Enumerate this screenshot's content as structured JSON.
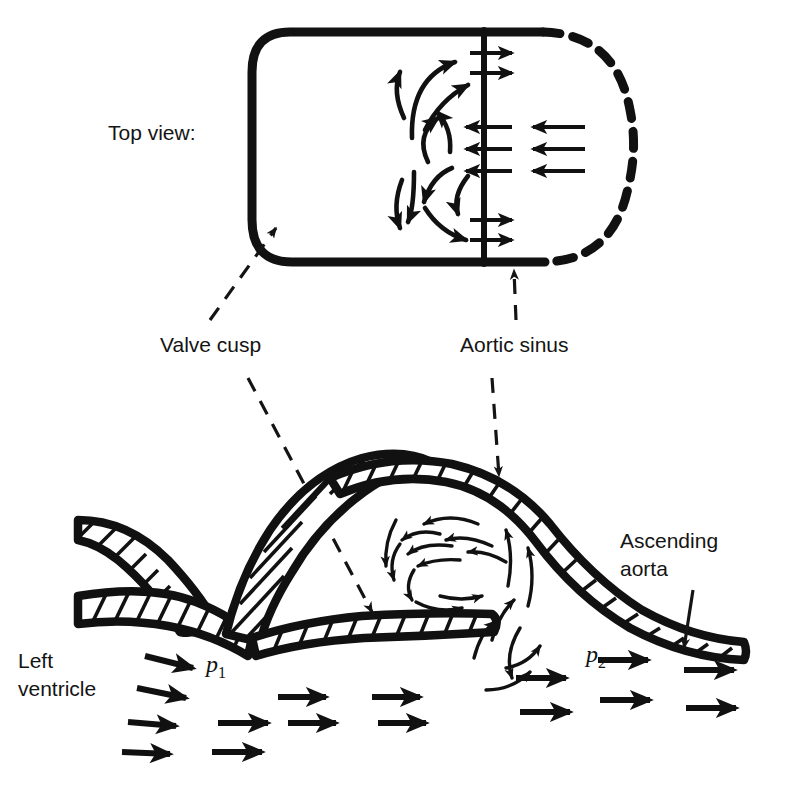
{
  "figure": {
    "background_color": "#ffffff",
    "ink_color": "#111111"
  },
  "labels": {
    "top_view": "Top view:",
    "valve_cusp": "Valve cusp",
    "aortic_sinus": "Aortic sinus",
    "ascending_aorta_line1": "Ascending",
    "ascending_aorta_line2": "aorta",
    "left_ventricle_line1": "Left",
    "left_ventricle_line2": "ventricle",
    "pressure_1": "p",
    "pressure_1_sub": "1",
    "pressure_2": "p",
    "pressure_2_sub": "2"
  },
  "top_view": {
    "description": "Plan view of one aortic sinus bounded by a solid valve-cusp wall on the left and a dashed aortic-wall arc on the right, split by a vertical divider line",
    "solid_wall_style": "solid",
    "dashed_wall_style": "dashed",
    "divider_label": "cusp free edge",
    "jet_rows": [
      {
        "row": 1,
        "direction": "right",
        "count": 2,
        "region": "upper"
      },
      {
        "row": 2,
        "direction": "left",
        "count": 3,
        "region": "middle"
      },
      {
        "row": 3,
        "direction": "right",
        "count": 2,
        "region": "lower"
      }
    ],
    "vortices": [
      {
        "name": "upper-recirculation",
        "rotation": "counterclockwise"
      },
      {
        "name": "lower-recirculation",
        "rotation": "clockwise"
      }
    ]
  },
  "side_view": {
    "description": "Longitudinal section through the left ventricular outflow tract, open aortic valve cusp, aortic sinus with vortex, and ascending aorta",
    "wall_fill": "hatched",
    "vortex": {
      "name": "sinus-vortex",
      "rotation": "clockwise"
    },
    "flow_field": {
      "direction": "left-to-right",
      "rows": 4,
      "columns": 4,
      "description": "Array of straight arrows representing forward ejection flow from left ventricle into ascending aorta"
    }
  }
}
